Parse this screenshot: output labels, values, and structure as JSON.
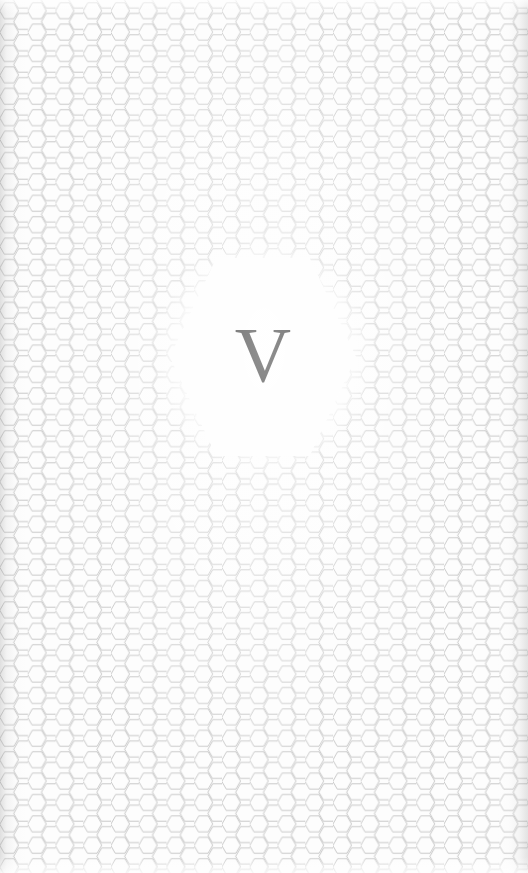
{
  "page": {
    "kind": "book-part-divider-page",
    "width": 528,
    "height": 873,
    "background_color": "#fdfdfd"
  },
  "background_pattern": {
    "name": "honeycomb-hexagon-tiling",
    "orientation": "flat-top",
    "hex_width": 18.5,
    "hex_height": 21.4,
    "column_pitch": 13.9,
    "row_pitch": 21.4,
    "line_color": "#b4b4b4",
    "line_width": 0.7,
    "fill_color": "#ffffff"
  },
  "clearing": {
    "name": "central-hexagon-clearing",
    "shape": "hexagon",
    "orientation": "flat-top",
    "left": 170,
    "top": 258,
    "width": 186,
    "height": 198,
    "fill_color": "#fefefe"
  },
  "part_label": {
    "numeral": "V",
    "type": "roman-numeral",
    "color": "#0b0b0b",
    "font_size_px": 78
  },
  "scan_artifacts": {
    "left_gutter_shadow": true,
    "right_edge_shadow": true,
    "top_fade": true,
    "bottom_fade": true
  }
}
